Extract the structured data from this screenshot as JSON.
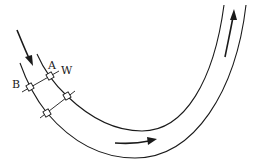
{
  "diagram": {
    "type": "curved-channel-flow",
    "labels": {
      "a": "A",
      "b": "B",
      "w": "W"
    },
    "nodes": [
      {
        "id": "A",
        "x": 50,
        "y": 76
      },
      {
        "id": "B",
        "x": 30,
        "y": 87
      },
      {
        "id": "C",
        "x": 67,
        "y": 96
      },
      {
        "id": "D",
        "x": 47,
        "y": 113
      }
    ],
    "arrows": [
      {
        "name": "inlet-flow",
        "direction": "down-right"
      },
      {
        "name": "bottom-flow",
        "direction": "right"
      },
      {
        "name": "outlet-flow",
        "direction": "up"
      }
    ],
    "colors": {
      "line": "#1a1a1a",
      "background": "#ffffff"
    }
  }
}
